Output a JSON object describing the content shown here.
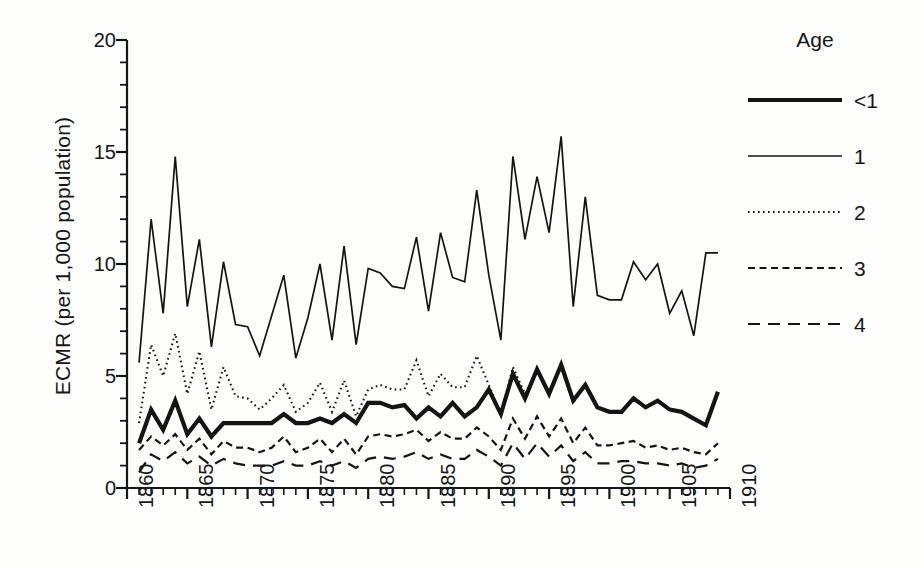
{
  "chart_data": {
    "type": "line",
    "title": "",
    "xlabel": "",
    "ylabel": "ECMR (per 1,000 population)",
    "xlim": [
      1860,
      1910
    ],
    "ylim": [
      0,
      20
    ],
    "grid": false,
    "legend_position": "right",
    "legend_title": "Age",
    "x_major_ticks": [
      1860,
      1865,
      1870,
      1875,
      1880,
      1885,
      1890,
      1895,
      1900,
      1905,
      1910
    ],
    "x_tick_labels": [
      "1860",
      "1865",
      "1870",
      "1875",
      "1880",
      "1885",
      "1890",
      "1895",
      "1900",
      "1905",
      "1910"
    ],
    "x_minor_tick_interval": 1,
    "y_major_ticks": [
      0,
      5,
      10,
      15,
      20
    ],
    "y_tick_labels": [
      "0",
      "5",
      "10",
      "15",
      "20"
    ],
    "y_minor_tick_interval": 1,
    "x": [
      1861,
      1862,
      1863,
      1864,
      1865,
      1866,
      1867,
      1868,
      1869,
      1870,
      1871,
      1872,
      1873,
      1874,
      1875,
      1876,
      1877,
      1878,
      1879,
      1880,
      1881,
      1882,
      1883,
      1884,
      1885,
      1886,
      1887,
      1888,
      1889,
      1890,
      1891,
      1892,
      1893,
      1894,
      1895,
      1896,
      1897,
      1898,
      1899,
      1900,
      1901,
      1902,
      1903,
      1904,
      1905,
      1906,
      1907,
      1908,
      1909
    ],
    "series": [
      {
        "name": "<1",
        "style": "thick-solid",
        "linewidth": 4.2,
        "color": "#141414",
        "values": [
          2.0,
          3.5,
          2.6,
          3.9,
          2.4,
          3.1,
          2.3,
          2.9,
          2.9,
          2.9,
          2.9,
          2.9,
          3.3,
          2.9,
          2.9,
          3.1,
          2.9,
          3.3,
          2.9,
          3.8,
          3.8,
          3.6,
          3.7,
          3.1,
          3.6,
          3.2,
          3.8,
          3.2,
          3.6,
          4.4,
          3.3,
          5.1,
          4.0,
          5.3,
          4.2,
          5.5,
          3.9,
          4.6,
          3.6,
          3.4,
          3.4,
          4.0,
          3.6,
          3.9,
          3.5,
          3.4,
          3.1,
          2.8,
          4.3
        ]
      },
      {
        "name": "1",
        "style": "thin-solid",
        "linewidth": 1.7,
        "color": "#141414",
        "values": [
          5.6,
          12.0,
          7.8,
          14.8,
          8.1,
          11.1,
          6.3,
          10.1,
          7.3,
          7.2,
          5.9,
          7.7,
          9.5,
          5.8,
          7.6,
          10.0,
          6.6,
          10.8,
          6.4,
          9.8,
          9.6,
          9.0,
          8.9,
          11.2,
          7.9,
          11.4,
          9.4,
          9.2,
          13.3,
          9.5,
          6.6,
          14.8,
          11.1,
          13.9,
          11.4,
          15.7,
          8.1,
          13.0,
          8.6,
          8.4,
          8.4,
          10.1,
          9.3,
          10.0,
          7.8,
          8.8,
          6.8,
          10.5,
          10.5
        ]
      },
      {
        "name": "2",
        "style": "dotted",
        "linewidth": 2.1,
        "color": "#141414",
        "values": [
          2.9,
          6.4,
          5.0,
          6.9,
          4.2,
          6.1,
          3.5,
          5.4,
          4.1,
          4.0,
          3.5,
          4.0,
          4.6,
          3.4,
          3.8,
          4.7,
          3.4,
          4.8,
          3.2,
          4.4,
          4.6,
          4.4,
          4.4,
          5.7,
          4.1,
          5.1,
          4.5,
          4.5,
          5.9,
          4.6,
          3.3,
          5.4,
          4.2,
          5.2,
          4.3,
          5.4,
          3.8,
          4.6,
          3.6,
          3.4,
          3.4,
          4.0,
          3.6,
          3.9,
          3.5,
          3.4,
          3.1,
          2.8,
          4.2
        ]
      },
      {
        "name": "3",
        "style": "short-dash",
        "linewidth": 2.2,
        "color": "#141414",
        "values": [
          1.7,
          2.3,
          1.9,
          2.4,
          1.7,
          2.2,
          1.5,
          2.1,
          1.8,
          1.8,
          1.6,
          1.8,
          2.3,
          1.6,
          1.8,
          2.2,
          1.6,
          2.2,
          1.5,
          2.3,
          2.4,
          2.3,
          2.4,
          2.6,
          2.1,
          2.5,
          2.2,
          2.2,
          2.7,
          2.3,
          1.7,
          3.1,
          2.2,
          3.2,
          2.3,
          3.1,
          2.0,
          2.7,
          1.9,
          1.9,
          2.0,
          2.1,
          1.8,
          1.9,
          1.7,
          1.8,
          1.6,
          1.5,
          2.0
        ]
      },
      {
        "name": "4",
        "style": "long-dash",
        "linewidth": 2.2,
        "color": "#141414",
        "values": [
          0.7,
          1.5,
          1.2,
          1.6,
          1.1,
          1.4,
          1.0,
          1.3,
          1.1,
          1.0,
          1.0,
          1.0,
          1.2,
          1.0,
          1.0,
          1.2,
          1.0,
          1.2,
          0.9,
          1.3,
          1.4,
          1.3,
          1.4,
          1.6,
          1.3,
          1.5,
          1.3,
          1.3,
          1.7,
          1.4,
          1.0,
          2.0,
          1.3,
          2.0,
          1.4,
          1.9,
          1.2,
          1.6,
          1.1,
          1.1,
          1.2,
          1.2,
          1.1,
          1.1,
          1.0,
          1.1,
          0.9,
          1.0,
          1.3
        ]
      }
    ]
  },
  "legend": {
    "title": "Age",
    "items": [
      {
        "label": "<1",
        "style": "thick-solid"
      },
      {
        "label": "1",
        "style": "thin-solid"
      },
      {
        "label": "2",
        "style": "dotted"
      },
      {
        "label": "3",
        "style": "short-dash"
      },
      {
        "label": "4",
        "style": "long-dash"
      }
    ]
  },
  "axes": {
    "y_label": "ECMR (per 1,000 population)",
    "y_ticks": [
      "0",
      "5",
      "10",
      "15",
      "20"
    ],
    "x_ticks": [
      "1860",
      "1865",
      "1870",
      "1875",
      "1880",
      "1885",
      "1890",
      "1895",
      "1900",
      "1905",
      "1910"
    ]
  },
  "colors": {
    "line": "#141414",
    "axis": "#161616",
    "background": "#fdfdfc"
  }
}
